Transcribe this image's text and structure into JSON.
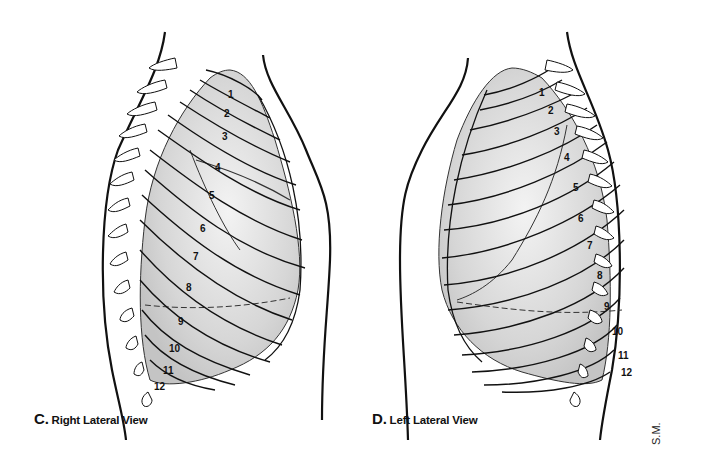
{
  "figure": {
    "panels": [
      {
        "id": "C",
        "letter": "C.",
        "title": "Right Lateral View",
        "ribs": [
          {
            "n": "1",
            "x": 231,
            "y": 95
          },
          {
            "n": "2",
            "x": 227,
            "y": 114
          },
          {
            "n": "3",
            "x": 225,
            "y": 137
          },
          {
            "n": "4",
            "x": 218,
            "y": 168
          },
          {
            "n": "5",
            "x": 212,
            "y": 196
          },
          {
            "n": "6",
            "x": 203,
            "y": 229
          },
          {
            "n": "7",
            "x": 196,
            "y": 257
          },
          {
            "n": "8",
            "x": 189,
            "y": 288
          },
          {
            "n": "9",
            "x": 181,
            "y": 322
          },
          {
            "n": "10",
            "x": 172,
            "y": 349
          },
          {
            "n": "11",
            "x": 166,
            "y": 371
          },
          {
            "n": "12",
            "x": 157,
            "y": 387
          }
        ]
      },
      {
        "id": "D",
        "letter": "D.",
        "title": "Left Lateral View",
        "ribs": [
          {
            "n": "1",
            "x": 180,
            "y": 93
          },
          {
            "n": "2",
            "x": 189,
            "y": 111
          },
          {
            "n": "3",
            "x": 195,
            "y": 132
          },
          {
            "n": "4",
            "x": 205,
            "y": 158
          },
          {
            "n": "5",
            "x": 214,
            "y": 188
          },
          {
            "n": "6",
            "x": 219,
            "y": 219
          },
          {
            "n": "7",
            "x": 228,
            "y": 246
          },
          {
            "n": "8",
            "x": 238,
            "y": 276
          },
          {
            "n": "9",
            "x": 245,
            "y": 307
          },
          {
            "n": "10",
            "x": 253,
            "y": 332
          },
          {
            "n": "11",
            "x": 259,
            "y": 356
          },
          {
            "n": "12",
            "x": 262,
            "y": 373
          }
        ]
      }
    ],
    "signature": "S.M.",
    "colors": {
      "line": "#111111",
      "lung_fill": "#d9d9d9",
      "lung_highlight": "#f2f2f2",
      "background": "#ffffff"
    }
  }
}
